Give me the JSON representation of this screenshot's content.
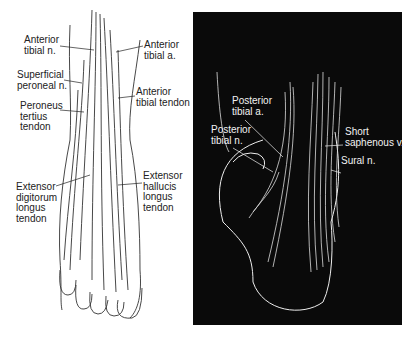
{
  "figure": {
    "left_panel": {
      "view": "dorsal foot (anterior)",
      "labels": [
        {
          "id": "anterior-tibial-n",
          "text": "Anterior\ntibial n.",
          "x": 24,
          "y": 35
        },
        {
          "id": "superficial-peroneal-n",
          "text": "Superficial\nperoneal n.",
          "x": 17,
          "y": 70
        },
        {
          "id": "peroneus-tertius-tendon",
          "text": "Peroneus\ntertius\ntendon",
          "x": 20,
          "y": 101
        },
        {
          "id": "extensor-digitorum-longus-tendon",
          "text": "Extensor\ndigitorum\nlongus\ntendon",
          "x": 16,
          "y": 182
        },
        {
          "id": "anterior-tibial-a",
          "text": "Anterior\ntibial a.",
          "x": 144,
          "y": 40
        },
        {
          "id": "anterior-tibial-tendon",
          "text": "Anterior\ntibial tendon",
          "x": 136,
          "y": 87
        },
        {
          "id": "extensor-hallucis-longus-tendon",
          "text": "Extensor\nhallucis\nlongus\ntendon",
          "x": 143,
          "y": 171
        }
      ]
    },
    "right_panel": {
      "view": "posterior/medial heel",
      "labels": [
        {
          "id": "posterior-tibial-a",
          "text": "Posterior\ntibial a.",
          "x": 232,
          "y": 96
        },
        {
          "id": "posterior-tibial-n",
          "text": "Posterior\ntibial n.",
          "x": 211,
          "y": 125
        },
        {
          "id": "short-saphenous-v",
          "text": "Short\nsaphenous v.",
          "x": 345,
          "y": 127
        },
        {
          "id": "sural-n",
          "text": "Sural n.",
          "x": 341,
          "y": 156
        }
      ]
    },
    "colors": {
      "left_bg": "#ffffff",
      "right_bg": "#0a0a0a",
      "ink": "#222222",
      "light_ink": "#f2f2f2"
    }
  }
}
